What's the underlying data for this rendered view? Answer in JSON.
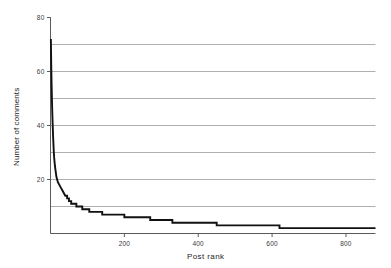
{
  "chart_data": {
    "type": "line",
    "title": "",
    "subtitle": "",
    "xlabel": "Post rank",
    "ylabel": "Number of comments",
    "xlim": [
      0,
      880
    ],
    "ylim": [
      0,
      80
    ],
    "xticks": [
      200,
      400,
      600,
      800
    ],
    "xtick_labels": [
      "200",
      "400",
      "600",
      "800"
    ],
    "yticks": [
      20,
      40,
      60,
      80
    ],
    "ytick_labels": [
      "20",
      "40",
      "60",
      "80"
    ],
    "gridlines_y": [
      10,
      20,
      30,
      40,
      50,
      60,
      70
    ],
    "grid": "horizontal",
    "legend": null,
    "legend_position": "none",
    "line_color": "#111111",
    "grid_color": "#9a9a9a",
    "axis_color": "#5a5a5a",
    "background": "#ffffff",
    "annotations": [],
    "series": [
      {
        "name": "comments per post",
        "x": [
          1,
          2,
          3,
          4,
          5,
          6,
          7,
          8,
          9,
          10,
          12,
          14,
          16,
          18,
          20,
          24,
          28,
          32,
          36,
          40,
          45,
          50,
          56,
          62,
          70,
          78,
          86,
          95,
          105,
          115,
          128,
          140,
          155,
          170,
          185,
          200,
          215,
          230,
          250,
          270,
          290,
          310,
          330,
          355,
          380,
          400,
          420,
          450,
          480,
          510,
          545,
          580,
          615,
          620,
          660,
          700,
          740,
          780,
          820,
          860,
          880
        ],
        "y": [
          72,
          62,
          55,
          49,
          44,
          40,
          36,
          33,
          30,
          28,
          25,
          23,
          21,
          20,
          19,
          18,
          17,
          16,
          15,
          14,
          13,
          12,
          11,
          11,
          10,
          10,
          9,
          9,
          8,
          8,
          8,
          7,
          7,
          7,
          7,
          6,
          6,
          6,
          6,
          5,
          5,
          5,
          4,
          4,
          4,
          4,
          4,
          3,
          3,
          3,
          3,
          3,
          3,
          2,
          2,
          2,
          2,
          2,
          2,
          2,
          2
        ]
      }
    ]
  },
  "axes": {
    "y_title": "Number of comments",
    "x_title": "Post rank",
    "y_tick_labels": [
      "80",
      "60",
      "40",
      "20"
    ],
    "x_tick_labels": [
      "200",
      "400",
      "600",
      "800"
    ]
  }
}
